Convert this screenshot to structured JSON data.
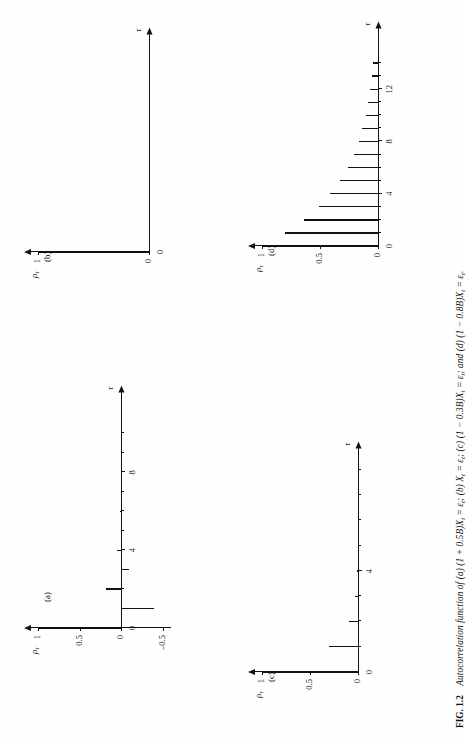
{
  "figure": {
    "number": "FIG. 1.2",
    "caption_text": "Autocorrelation function of (a) (1 + 0.5B)X",
    "caption_full": "FIG. 1.2  Autocorrelation function of (a) (1 + 0.5B)Xₜ = εₜ; (b) Xₜ = εₜ; (c) (1 − 0.3B)Xₜ = εₜ; and (d) (1 − 0.8B)Xₜ = εₜ.",
    "caption_parts": {
      "lead": "Autocorrelation function of",
      "a": "(a) (1 + 0.5B)X",
      "b": "(b) X",
      "c": "(c) (1 − 0.3B)X",
      "d": "and (d) (1 − 0.8B)X",
      "eq": "= ε",
      "sub_t": "t",
      "semi": ";",
      "period": "."
    },
    "rotation_deg": -90,
    "ink_color": "#111111",
    "paper_color": "#fefefe"
  },
  "axis_labels": {
    "y_label": "ρ",
    "y_label_sub": "τ",
    "x_label": "τ",
    "y_one": "1",
    "y_half": "0.5",
    "y_zero": "0",
    "y_neg_half": "–0.5",
    "x_zero": "0"
  },
  "chart_data": [
    {
      "id": "a",
      "type": "bar",
      "panel_label": "(a)",
      "title": "(1 + 0.5B)X_t = e_t",
      "xlabel": "τ",
      "ylabel": "ρ_τ",
      "ylim": [
        -0.6,
        1.0
      ],
      "xlim": [
        0,
        11
      ],
      "yticks": [
        1,
        0.5,
        0,
        -0.5
      ],
      "ytick_labels": [
        "1",
        "0.5",
        "0",
        "–0.5"
      ],
      "xticks": [
        0,
        1,
        2,
        3,
        4,
        5,
        6,
        7,
        8,
        9,
        10
      ],
      "xtick_labels_shown": {
        "0": "0",
        "4": "4",
        "8": "8"
      },
      "x": [
        0,
        1,
        2,
        3,
        4,
        5,
        6,
        7,
        8,
        9,
        10
      ],
      "values": [
        1.0,
        -0.4,
        0.18,
        -0.09,
        0.05,
        -0.02,
        0.01,
        0.0,
        0.0,
        0.0,
        0.0
      ],
      "grid": false,
      "legend": false
    },
    {
      "id": "b",
      "type": "bar",
      "panel_label": "(b)",
      "title": "X_t = e_t",
      "xlabel": "τ",
      "ylabel": "ρ_τ",
      "ylim": [
        0,
        1.0
      ],
      "xlim": [
        0,
        14
      ],
      "yticks": [
        1,
        0
      ],
      "ytick_labels": [
        "1",
        "0"
      ],
      "xticks": [
        0
      ],
      "xtick_labels_shown": {
        "0": "0"
      },
      "x": [
        0,
        1,
        2,
        3,
        4,
        5,
        6,
        7,
        8,
        9,
        10,
        11,
        12,
        13,
        14
      ],
      "values": [
        1.0,
        0,
        0,
        0,
        0,
        0,
        0,
        0,
        0,
        0,
        0,
        0,
        0,
        0,
        0
      ],
      "grid": false,
      "legend": false
    },
    {
      "id": "c",
      "type": "bar",
      "panel_label": "(c)",
      "title": "(1 − 0.3B)X_t = e_t",
      "xlabel": "τ",
      "ylabel": "ρ_τ",
      "ylim": [
        0,
        1.0
      ],
      "xlim": [
        0,
        8
      ],
      "yticks": [
        1,
        0.5,
        0
      ],
      "ytick_labels": [
        "1",
        "0.5",
        "0"
      ],
      "xticks": [
        0,
        1,
        2,
        3,
        4,
        5,
        6,
        7,
        8
      ],
      "xtick_labels_shown": {
        "0": "0",
        "4": "4"
      },
      "x": [
        0,
        1,
        2,
        3,
        4,
        5,
        6,
        7,
        8
      ],
      "values": [
        1.0,
        0.3,
        0.09,
        0.027,
        0.008,
        0.0,
        0.0,
        0.0,
        0.0
      ],
      "grid": false,
      "legend": false
    },
    {
      "id": "d",
      "type": "bar",
      "panel_label": "(d)",
      "title": "(1 − 0.8B)X_t = e_t",
      "xlabel": "τ",
      "ylabel": "ρ_τ",
      "ylim": [
        0,
        1.0
      ],
      "xlim": [
        0,
        15
      ],
      "yticks": [
        1,
        0.5,
        0
      ],
      "ytick_labels": [
        "1",
        "0.5",
        "0"
      ],
      "xticks": [
        0,
        1,
        2,
        3,
        4,
        5,
        6,
        7,
        8,
        9,
        10,
        11,
        12,
        13,
        14
      ],
      "xtick_labels_shown": {
        "0": "0",
        "4": "4",
        "8": "8",
        "12": "12"
      },
      "x": [
        0,
        1,
        2,
        3,
        4,
        5,
        6,
        7,
        8,
        9,
        10,
        11,
        12,
        13,
        14
      ],
      "values": [
        1.0,
        0.8,
        0.64,
        0.512,
        0.41,
        0.328,
        0.262,
        0.21,
        0.168,
        0.134,
        0.107,
        0.086,
        0.069,
        0.055,
        0.044
      ],
      "grid": false,
      "legend": false
    }
  ]
}
